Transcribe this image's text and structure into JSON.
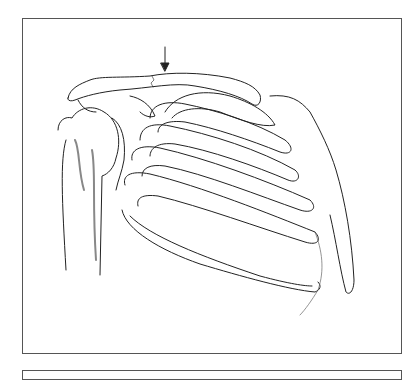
{
  "image": {
    "subject": "shoulder-and-rib-cage-illustration",
    "style": "pencil drawing",
    "annotation": "arrow-pointing-to-clavicle-fracture",
    "colors": {
      "line": "#222222",
      "shade": "#888888",
      "frame": "#555555",
      "background": "#ffffff"
    }
  }
}
